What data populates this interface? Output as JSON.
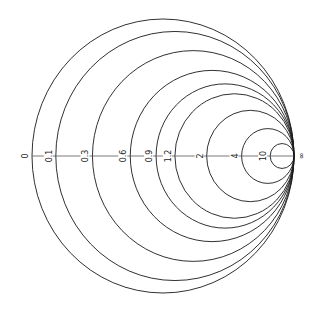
{
  "diagram": {
    "type": "smith-chart-constant-resistance-circles",
    "geometry": {
      "cx": 163,
      "cy": 156,
      "rx": 131,
      "ry": 137
    },
    "axis_color": "#555555",
    "stroke_color": "#1a1a1a",
    "resistance_values": [
      0,
      0.1,
      0.3,
      0.6,
      0.9,
      1.2,
      2,
      4,
      10
    ],
    "labels": [
      "0",
      "0.1",
      "0.3",
      "0.6",
      "0.9",
      "1.2",
      "2",
      "4",
      "10"
    ],
    "infinity_label": "∞"
  }
}
